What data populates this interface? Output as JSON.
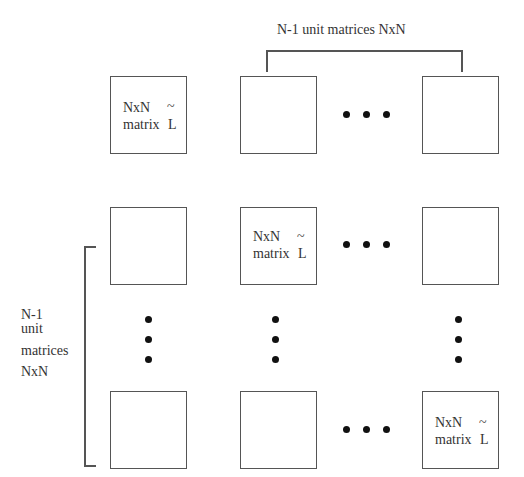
{
  "diagram": {
    "top_brace_label": "N-1 unit matrices NxN",
    "left_brace_label": [
      "N-1",
      "unit",
      "matrices",
      "NxN"
    ],
    "matrix_label_line1": "NxN",
    "matrix_label_line2": "matrix",
    "matrix_symbol": "L",
    "tilde": "~",
    "grid": {
      "rows": [
        {
          "cells": [
            "NxN matrix L~",
            "empty",
            "ellipsis",
            "empty"
          ]
        },
        {
          "cells": [
            "empty",
            "NxN matrix L~",
            "ellipsis",
            "empty"
          ]
        },
        {
          "cells": [
            "vertical-ellipsis",
            "vertical-ellipsis",
            "",
            "vertical-ellipsis"
          ]
        },
        {
          "cells": [
            "empty",
            "empty",
            "ellipsis",
            "NxN matrix L~"
          ]
        }
      ]
    }
  }
}
